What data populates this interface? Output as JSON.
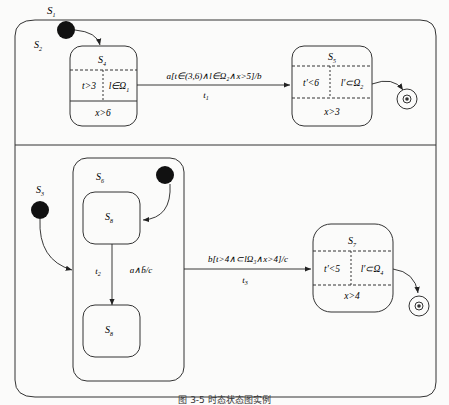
{
  "diagram": {
    "type": "temporal statechart",
    "outer_state": "S1",
    "regions": [
      {
        "name": "S2",
        "states": [
          {
            "name": "S4",
            "cells": [
              "t>3",
              "l∈Ω₁"
            ],
            "bottom": "x>6"
          },
          {
            "name": "S5",
            "cells": [
              "t′<6",
              "l′∈Ω₂"
            ],
            "bottom": "x>3"
          }
        ],
        "transition": {
          "label": "a[t∈(3,6)∧l∈Ω₂∧x>5]/b",
          "name": "t₁"
        }
      },
      {
        "name": "S3",
        "composite": "S6",
        "inner_states": [
          "S8",
          "S8"
        ],
        "inner_transition": {
          "label": "a∧b̄/c",
          "name": "t₂"
        },
        "states": [
          {
            "name": "S7",
            "cells": [
              "t′<5",
              "l′∈Ω₄"
            ],
            "bottom": "x>4"
          }
        ],
        "transition": {
          "label": "b[t>4∧⊂lΩ₃∧x>4]/c",
          "name": "t₃"
        }
      }
    ]
  },
  "labels": {
    "s1": "S",
    "s1_sub": "1",
    "s2": "S",
    "s2_sub": "2",
    "s3": "S",
    "s3_sub": "3",
    "s4": "S",
    "s4_sub": "4",
    "s5": "S",
    "s5_sub": "5",
    "s6": "S",
    "s6_sub": "6",
    "s7": "S",
    "s7_sub": "7",
    "s8a": "S",
    "s8a_sub": "8",
    "s8b": "S",
    "s8b_sub": "8",
    "s4_left": "t>3",
    "s4_right": "l∈Ω",
    "s4_right_sub": "1",
    "s4_bottom": "x>6",
    "s5_left": "t′<6",
    "s5_right": "l′⊂Ω",
    "s5_right_sub": "2",
    "s5_bottom": "x>3",
    "s7_left": "t′<5",
    "s7_right": "l′⊂Ω",
    "s7_right_sub": "4",
    "s7_bottom": "x>4",
    "t1_label": "a[t∈(3,6)∧l∈Ω₂∧x>5]/b",
    "t1_name": "t",
    "t1_sub": "1",
    "t2_label": "a∧b̄/c",
    "t2_name": "t",
    "t2_sub": "2",
    "t3_label": "b[t>4∧⊂lΩ₃∧x>4]/c",
    "t3_name": "t",
    "t3_sub": "3"
  },
  "caption": "图 3-5 时态状态图实例"
}
